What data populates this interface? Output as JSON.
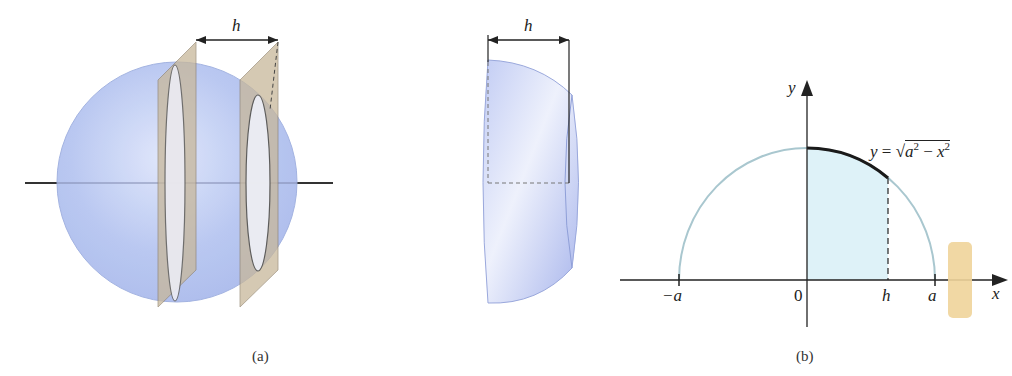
{
  "figure": {
    "top_cut_text": "",
    "panel_a": {
      "caption": "(a)",
      "left_dimension_label": "h",
      "middle_dimension_label": "h"
    },
    "panel_b": {
      "caption": "(b)",
      "y_axis_label": "y",
      "x_axis_label": "x",
      "equation": "y = √a² − x²",
      "equation_parts": {
        "lhs": "y =",
        "radicand_a": "a",
        "radicand_rest": " − x",
        "sup": "2"
      },
      "tick_labels": {
        "neg_a": "−a",
        "zero": "0",
        "h": "h",
        "a": "a"
      }
    },
    "colors": {
      "sphere_fill": "#b9c8f0",
      "plane_fill": "#c8b89a",
      "shaded_region": "#dff3f8",
      "semicircle": "#a9c7cf",
      "curve_highlight": "#1a1a1a"
    }
  }
}
